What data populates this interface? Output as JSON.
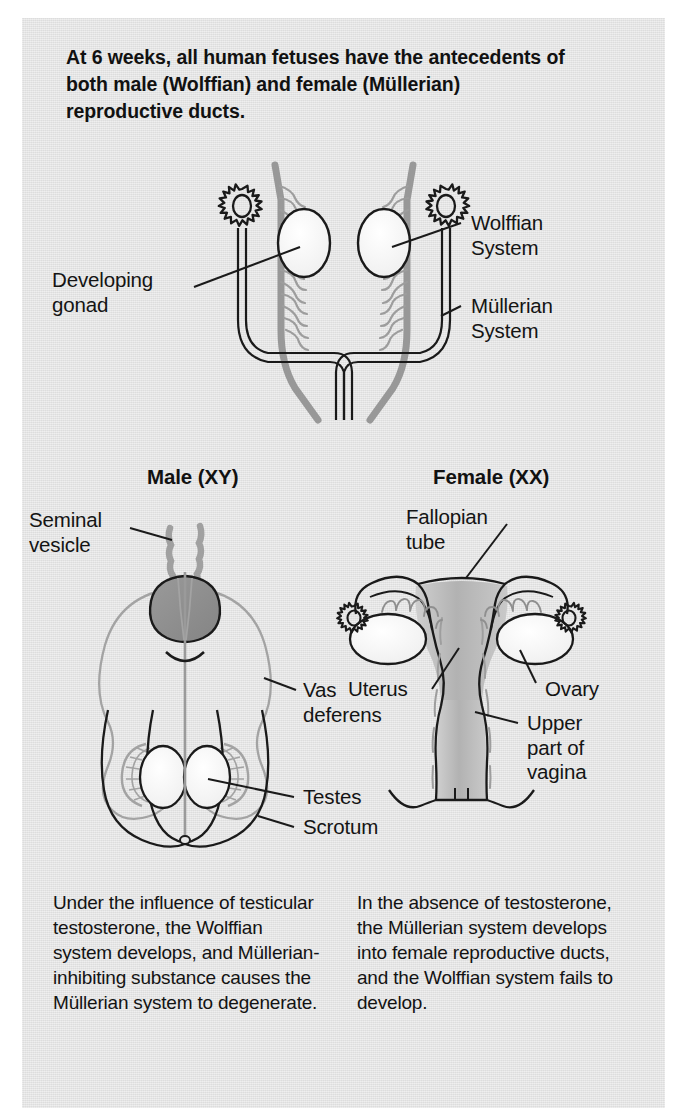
{
  "figure": {
    "background_color": "#e2e2e2",
    "page_color": "#ffffff",
    "title": "At 6 weeks, all human fetuses have the antecedents of both male (Wolffian) and female (Müllerian) reproductive ducts."
  },
  "colors": {
    "wolffian_gray": "#9a9a9a",
    "mullerian_black": "#1a1a1a",
    "prostate_dark_gray": "#8d8d8d",
    "uterus_gray": "#b9b9b9",
    "organ_white": "#f4f4f4",
    "text_black": "#141414"
  },
  "top_diagram": {
    "name": "indifferent-stage-6-weeks",
    "labels": [
      {
        "id": "developing-gonad",
        "text": "Developing\ngonad"
      },
      {
        "id": "wolffian-system",
        "text": "Wolffian\nSystem"
      },
      {
        "id": "mullerian-system",
        "text": "Müllerian\nSystem"
      }
    ],
    "structures": [
      {
        "id": "gonad",
        "count": 2,
        "fill": "#f4f4f4"
      },
      {
        "id": "mesonephric-tubules",
        "count": 2,
        "fill": "#9a9a9a"
      },
      {
        "id": "gear-rosette",
        "count": 2,
        "points": 10
      }
    ]
  },
  "male_panel": {
    "heading": "Male (XY)",
    "chromosomes": "XY",
    "labels": [
      {
        "id": "seminal-vesicle",
        "text": "Seminal\nvesicle"
      },
      {
        "id": "vas-deferens",
        "text": "Vas\ndeferens"
      },
      {
        "id": "testes",
        "text": "Testes"
      },
      {
        "id": "scrotum",
        "text": "Scrotum"
      }
    ],
    "caption": "Under the influence of testicular testosterone, the Wolffian system develops, and Müllerian-inhibiting substance causes the Müllerian system to degenerate."
  },
  "female_panel": {
    "heading": "Female (XX)",
    "chromosomes": "XX",
    "labels": [
      {
        "id": "fallopian-tube",
        "text": "Fallopian\ntube"
      },
      {
        "id": "uterus",
        "text": "Uterus"
      },
      {
        "id": "ovary",
        "text": "Ovary"
      },
      {
        "id": "upper-part-of-vagina",
        "text": "Upper\npart of\nvagina"
      }
    ],
    "caption": "In the absence of testosterone, the Müllerian system develops into female reproductive ducts, and the Wolffian system fails to develop."
  }
}
